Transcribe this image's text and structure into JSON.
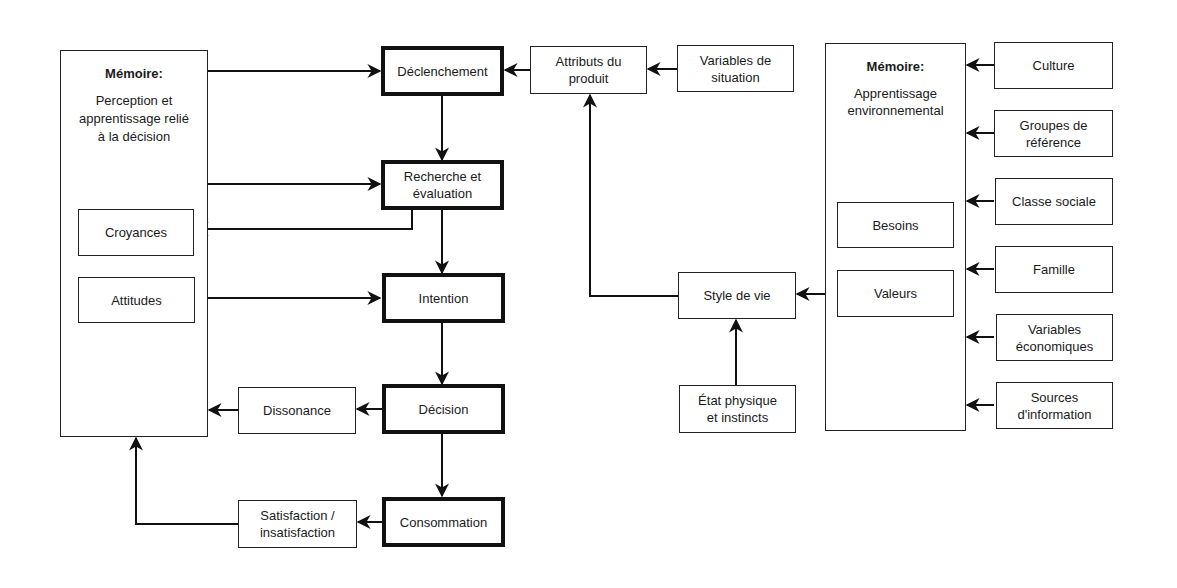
{
  "diagram": {
    "left_memory": {
      "title": "Mémoire:",
      "body": "Perception et apprentissage relié à la décision",
      "children": {
        "beliefs": "Croyances",
        "attitudes": "Attitudes"
      }
    },
    "process": {
      "trigger": "Déclenchement",
      "search": "Recherche et évaluation",
      "intention": "Intention",
      "decision": "Décision",
      "consumption": "Consommation"
    },
    "feedback": {
      "dissonance": "Dissonance",
      "satisfaction": "Satisfaction / insatisfaction"
    },
    "middle": {
      "product_attributes": "Attributs du produit",
      "situational_variables": "Variables de situation",
      "lifestyle": "Style de vie",
      "physical_state": "État physique et instincts"
    },
    "right_memory": {
      "title": "Mémoire:",
      "body": "Apprentissage environnemental",
      "children": {
        "needs": "Besoins",
        "values": "Valeurs"
      }
    },
    "influences": [
      "Culture",
      "Groupes de référence",
      "Classe sociale",
      "Famille",
      "Variables économiques",
      "Sources d'information"
    ],
    "colors": {
      "line": "#111111",
      "background": "#ffffff"
    }
  }
}
